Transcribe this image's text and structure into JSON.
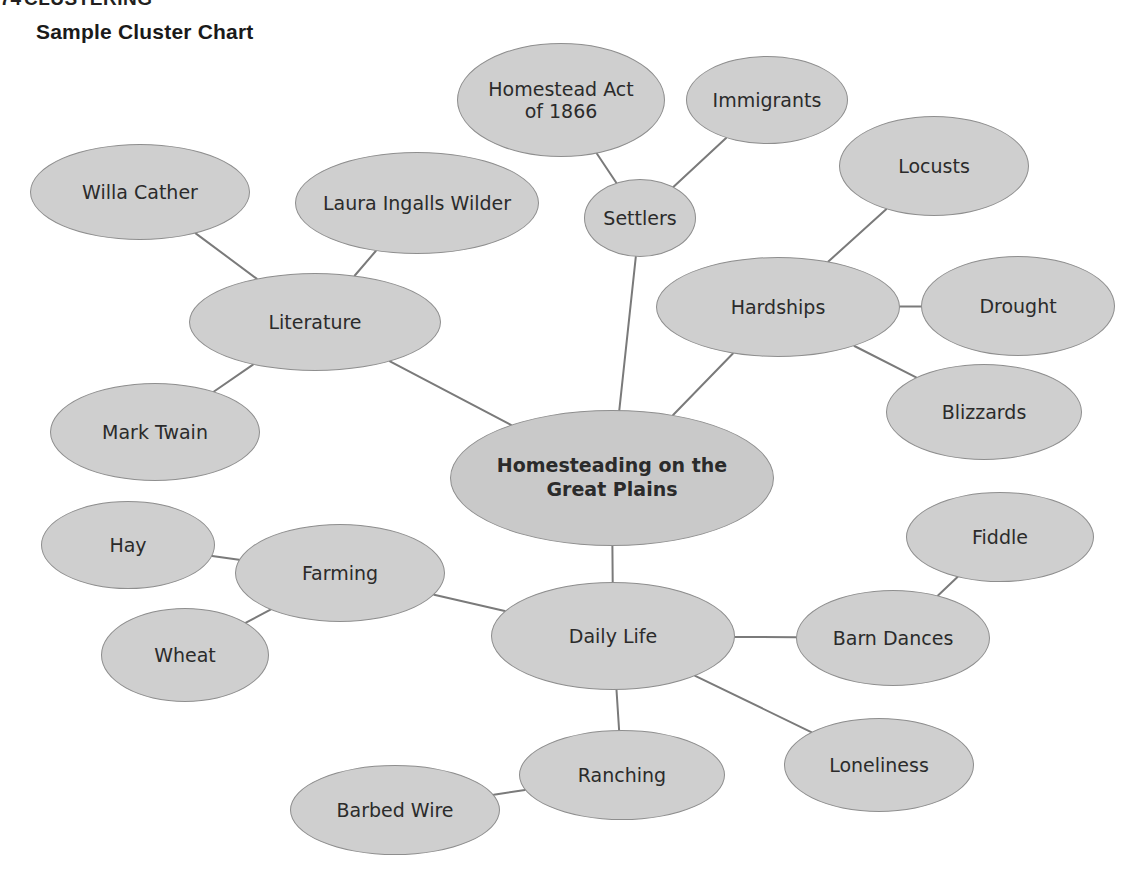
{
  "page": {
    "section_number": "74",
    "section_heading": "CLUSTERING",
    "chart_title": "Sample Cluster Chart",
    "background_color": "#ffffff",
    "node_fill_color": "#cfcfcf",
    "node_stroke_color": "#8e8e8e",
    "edge_color": "#7a7a7a",
    "text_color": "#2b2b2b"
  },
  "chart_data": {
    "type": "diagram",
    "subtype": "cluster-chart",
    "title": "Sample Cluster Chart",
    "center": "Homesteading on the Great Plains",
    "nodes": [
      {
        "id": "center",
        "label": "Homesteading on the\nGreat Plains",
        "line1": "Homesteading on the",
        "line2": "Great Plains",
        "level": 0,
        "cx": 612,
        "cy": 478,
        "rx": 162,
        "ry": 68
      },
      {
        "id": "settlers",
        "label": "Settlers",
        "level": 1,
        "cx": 640,
        "cy": 218,
        "rx": 56,
        "ry": 39
      },
      {
        "id": "homestead_act",
        "label": "Homestead Act\nof 1866",
        "line1": "Homestead Act",
        "line2": "of 1866",
        "level": 2,
        "cx": 561,
        "cy": 100,
        "rx": 104,
        "ry": 57
      },
      {
        "id": "immigrants",
        "label": "Immigrants",
        "level": 2,
        "cx": 767,
        "cy": 100,
        "rx": 81,
        "ry": 44
      },
      {
        "id": "hardships",
        "label": "Hardships",
        "level": 1,
        "cx": 778,
        "cy": 307,
        "rx": 122,
        "ry": 50
      },
      {
        "id": "locusts",
        "label": "Locusts",
        "level": 2,
        "cx": 934,
        "cy": 166,
        "rx": 95,
        "ry": 50
      },
      {
        "id": "drought",
        "label": "Drought",
        "level": 2,
        "cx": 1018,
        "cy": 306,
        "rx": 97,
        "ry": 50
      },
      {
        "id": "blizzards",
        "label": "Blizzards",
        "level": 2,
        "cx": 984,
        "cy": 412,
        "rx": 98,
        "ry": 48
      },
      {
        "id": "literature",
        "label": "Literature",
        "level": 1,
        "cx": 315,
        "cy": 322,
        "rx": 126,
        "ry": 49
      },
      {
        "id": "willa_cather",
        "label": "Willa Cather",
        "level": 2,
        "cx": 140,
        "cy": 192,
        "rx": 110,
        "ry": 48
      },
      {
        "id": "laura_wilder",
        "label": "Laura Ingalls Wilder",
        "level": 2,
        "cx": 417,
        "cy": 203,
        "rx": 122,
        "ry": 51
      },
      {
        "id": "mark_twain",
        "label": "Mark Twain",
        "level": 2,
        "cx": 155,
        "cy": 432,
        "rx": 105,
        "ry": 49
      },
      {
        "id": "daily_life",
        "label": "Daily Life",
        "level": 1,
        "cx": 613,
        "cy": 636,
        "rx": 122,
        "ry": 54
      },
      {
        "id": "farming",
        "label": "Farming",
        "level": 2,
        "cx": 340,
        "cy": 573,
        "rx": 105,
        "ry": 49
      },
      {
        "id": "hay",
        "label": "Hay",
        "level": 3,
        "cx": 128,
        "cy": 545,
        "rx": 87,
        "ry": 44
      },
      {
        "id": "wheat",
        "label": "Wheat",
        "level": 3,
        "cx": 185,
        "cy": 655,
        "rx": 84,
        "ry": 47
      },
      {
        "id": "ranching",
        "label": "Ranching",
        "level": 2,
        "cx": 622,
        "cy": 775,
        "rx": 103,
        "ry": 45
      },
      {
        "id": "barbed_wire",
        "label": "Barbed Wire",
        "level": 3,
        "cx": 395,
        "cy": 810,
        "rx": 105,
        "ry": 45
      },
      {
        "id": "barn_dances",
        "label": "Barn Dances",
        "level": 2,
        "cx": 893,
        "cy": 638,
        "rx": 97,
        "ry": 48
      },
      {
        "id": "fiddle",
        "label": "Fiddle",
        "level": 3,
        "cx": 1000,
        "cy": 537,
        "rx": 94,
        "ry": 45
      },
      {
        "id": "loneliness",
        "label": "Loneliness",
        "level": 2,
        "cx": 879,
        "cy": 765,
        "rx": 95,
        "ry": 47
      }
    ],
    "edges": [
      {
        "from": "center",
        "to": "settlers"
      },
      {
        "from": "settlers",
        "to": "homestead_act"
      },
      {
        "from": "settlers",
        "to": "immigrants"
      },
      {
        "from": "center",
        "to": "hardships"
      },
      {
        "from": "hardships",
        "to": "locusts"
      },
      {
        "from": "hardships",
        "to": "drought"
      },
      {
        "from": "hardships",
        "to": "blizzards"
      },
      {
        "from": "center",
        "to": "literature"
      },
      {
        "from": "literature",
        "to": "willa_cather"
      },
      {
        "from": "literature",
        "to": "laura_wilder"
      },
      {
        "from": "literature",
        "to": "mark_twain"
      },
      {
        "from": "center",
        "to": "daily_life"
      },
      {
        "from": "daily_life",
        "to": "farming"
      },
      {
        "from": "farming",
        "to": "hay"
      },
      {
        "from": "farming",
        "to": "wheat"
      },
      {
        "from": "daily_life",
        "to": "ranching"
      },
      {
        "from": "ranching",
        "to": "barbed_wire"
      },
      {
        "from": "daily_life",
        "to": "barn_dances"
      },
      {
        "from": "barn_dances",
        "to": "fiddle"
      },
      {
        "from": "daily_life",
        "to": "loneliness"
      }
    ]
  }
}
